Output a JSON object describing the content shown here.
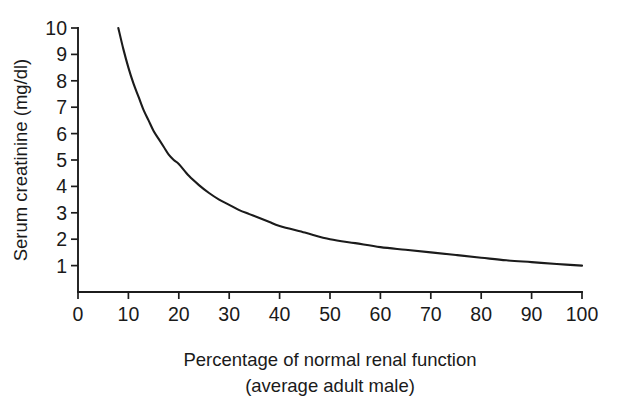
{
  "chart_data": {
    "type": "line",
    "title": "",
    "xlabel": "Percentage of normal renal function (average adult male)",
    "xlabel_line1": "Percentage of normal renal function",
    "xlabel_line2": "(average adult male)",
    "ylabel": "Serum creatinine (mg/dl)",
    "xlim": [
      0,
      100
    ],
    "ylim": [
      0,
      10
    ],
    "grid": false,
    "legend": false,
    "xticks": [
      0,
      10,
      20,
      30,
      40,
      50,
      60,
      70,
      80,
      90,
      100
    ],
    "xticklabels": [
      "0",
      "10",
      "20",
      "30",
      "40",
      "50",
      "60",
      "70",
      "80",
      "90",
      "100"
    ],
    "yticks": [
      1,
      2,
      3,
      4,
      5,
      6,
      7,
      8,
      9,
      10
    ],
    "yticklabels": [
      "1",
      "2",
      "3",
      "4",
      "5",
      "6",
      "7",
      "8",
      "9",
      "10"
    ],
    "series": [
      {
        "name": "Serum creatinine",
        "relation": "y = 100 / x",
        "color": "#1b1b1b",
        "x": [
          8,
          9,
          10,
          11,
          12,
          13,
          14,
          15,
          16,
          17,
          18,
          19,
          20,
          22,
          24,
          26,
          28,
          30,
          32,
          34,
          36,
          38,
          40,
          45,
          50,
          55,
          60,
          65,
          70,
          75,
          80,
          85,
          90,
          95,
          100
        ],
        "y": [
          10.0,
          9.2,
          8.5,
          7.9,
          7.4,
          6.9,
          6.5,
          6.1,
          5.8,
          5.5,
          5.2,
          5.0,
          4.85,
          4.4,
          4.05,
          3.75,
          3.5,
          3.3,
          3.1,
          2.95,
          2.8,
          2.65,
          2.5,
          2.25,
          2.0,
          1.85,
          1.7,
          1.6,
          1.5,
          1.4,
          1.3,
          1.2,
          1.13,
          1.06,
          1.0
        ]
      }
    ],
    "annotations": []
  },
  "axes": {
    "y_axis_title": "Serum creatinine (mg/dl)",
    "x_axis_title_line1": "Percentage of normal renal function",
    "x_axis_title_line2": "(average adult male)"
  },
  "colors": {
    "background": "#ffffff",
    "ink": "#1a1a1a",
    "curve": "#1b1b1b"
  }
}
